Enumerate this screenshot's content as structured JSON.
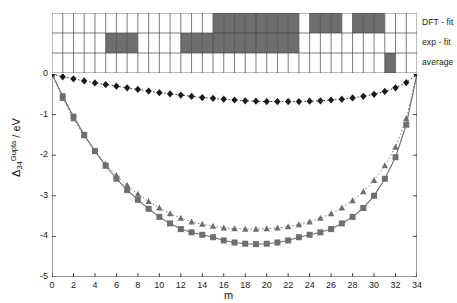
{
  "chart_data": {
    "type": "line",
    "title": "",
    "xlabel": "m",
    "ylabel": "Delta_34^Gupta / eV",
    "ylabel_parts": {
      "delta": "Δ",
      "sub": "34",
      "sup": "Gupta",
      "unit": "/ eV"
    },
    "xlim": [
      0,
      34
    ],
    "ylim": [
      -5,
      0
    ],
    "xticks": [
      0,
      2,
      4,
      6,
      8,
      10,
      12,
      14,
      16,
      18,
      20,
      22,
      24,
      26,
      28,
      30,
      32,
      34
    ],
    "yticks": [
      0,
      -1,
      -2,
      -3,
      -4,
      -5
    ],
    "xtick_labels": [
      "0",
      "2",
      "4",
      "6",
      "8",
      "10",
      "12",
      "14",
      "16",
      "18",
      "20",
      "22",
      "24",
      "26",
      "28",
      "30",
      "32",
      "34"
    ],
    "ytick_labels": [
      "0",
      "-1",
      "-2",
      "-3",
      "-4",
      "-5"
    ],
    "grid": false,
    "legend": "none",
    "x": [
      0,
      1,
      2,
      3,
      4,
      5,
      6,
      7,
      8,
      9,
      10,
      11,
      12,
      13,
      14,
      15,
      16,
      17,
      18,
      19,
      20,
      21,
      22,
      23,
      24,
      25,
      26,
      27,
      28,
      29,
      30,
      31,
      32,
      33,
      34
    ],
    "series": [
      {
        "name": "diamond-series",
        "marker": "diamond",
        "linestyle": "dotted",
        "color": "#1a1a1a",
        "values": [
          0.0,
          -0.07,
          -0.12,
          -0.17,
          -0.22,
          -0.26,
          -0.3,
          -0.34,
          -0.38,
          -0.42,
          -0.46,
          -0.49,
          -0.52,
          -0.55,
          -0.58,
          -0.6,
          -0.62,
          -0.64,
          -0.66,
          -0.67,
          -0.68,
          -0.68,
          -0.68,
          -0.68,
          -0.67,
          -0.66,
          -0.64,
          -0.62,
          -0.59,
          -0.55,
          -0.5,
          -0.43,
          -0.34,
          -0.21,
          0.0
        ]
      },
      {
        "name": "triangle-series",
        "marker": "triangle",
        "linestyle": "dotted",
        "color": "#6e6e6e",
        "values": [
          0.0,
          -0.6,
          -1.1,
          -1.52,
          -1.9,
          -2.22,
          -2.5,
          -2.74,
          -2.96,
          -3.14,
          -3.3,
          -3.44,
          -3.55,
          -3.64,
          -3.7,
          -3.75,
          -3.79,
          -3.81,
          -3.82,
          -3.82,
          -3.81,
          -3.79,
          -3.76,
          -3.71,
          -3.64,
          -3.55,
          -3.44,
          -3.3,
          -3.12,
          -2.9,
          -2.62,
          -2.26,
          -1.8,
          -1.1,
          0.0
        ]
      },
      {
        "name": "square-series",
        "marker": "square",
        "linestyle": "solid",
        "color": "#6e6e6e",
        "values": [
          0.0,
          -0.55,
          -1.05,
          -1.5,
          -1.9,
          -2.26,
          -2.58,
          -2.86,
          -3.1,
          -3.32,
          -3.52,
          -3.68,
          -3.82,
          -3.9,
          -3.96,
          -4.02,
          -4.1,
          -4.15,
          -4.18,
          -4.19,
          -4.18,
          -4.15,
          -4.1,
          -4.02,
          -3.96,
          -3.9,
          -3.82,
          -3.68,
          -3.52,
          -3.3,
          -3.0,
          -2.58,
          -2.05,
          -1.25,
          0.0
        ]
      }
    ]
  },
  "matrix": {
    "n_columns": 34,
    "fill_color": "#6e6e6e",
    "empty_color": "#ffffff",
    "border_color": "#444444",
    "rows": [
      {
        "label": "DFT - fit",
        "name": "row-dft-fit",
        "filled": [
          15,
          16,
          17,
          18,
          19,
          20,
          21,
          22,
          24,
          25,
          26,
          28,
          29,
          30
        ]
      },
      {
        "label": "exp - fit",
        "name": "row-exp-fit",
        "filled": [
          5,
          6,
          7,
          12,
          13,
          14,
          15,
          16,
          17,
          18,
          19,
          20,
          21,
          22
        ]
      },
      {
        "label": "average",
        "name": "row-average",
        "filled": [
          31
        ]
      }
    ]
  }
}
